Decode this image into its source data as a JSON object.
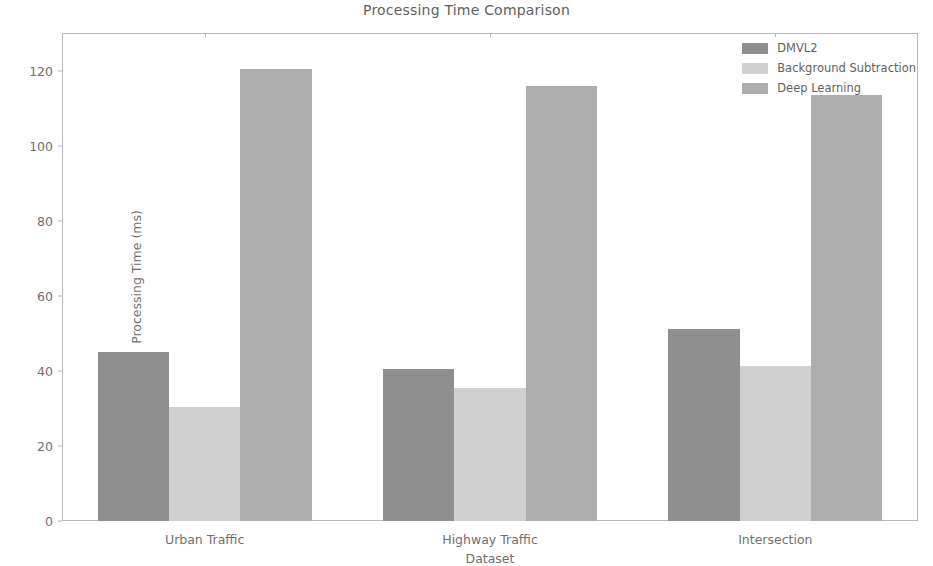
{
  "figure": {
    "title": "Processing Time Comparison",
    "caption_bleed": ""
  },
  "chart_data": {
    "type": "bar",
    "title": "Processing Time Comparison",
    "xlabel": "Dataset",
    "ylabel": "Processing Time (ms)",
    "categories": [
      "Urban Traffic",
      "Highway Traffic",
      "Intersection"
    ],
    "series": [
      {
        "name": "DMVL2",
        "values": [
          45.0,
          40.4,
          51.2
        ],
        "color": "#8f8f8f"
      },
      {
        "name": "Background Subtraction",
        "values": [
          30.5,
          35.5,
          41.4
        ],
        "color": "#d0d0d0"
      },
      {
        "name": "Deep Learning",
        "values": [
          120.5,
          115.8,
          113.5
        ],
        "color": "#adadad"
      }
    ],
    "ylim": [
      0,
      130
    ],
    "yticks": [
      0,
      20,
      40,
      60,
      80,
      100,
      120
    ],
    "ytick_labels": [
      "0",
      "20",
      "40",
      "60",
      "80",
      "100",
      "120"
    ],
    "grid": false,
    "legend_position": "upper right",
    "bar_width": 0.25
  },
  "legend": {
    "entries": [
      {
        "label": "DMVL2",
        "color": "#8f8f8f"
      },
      {
        "label": "Background Subtraction",
        "color": "#d0d0d0"
      },
      {
        "label": "Deep Learning",
        "color": "#adadad"
      }
    ]
  }
}
